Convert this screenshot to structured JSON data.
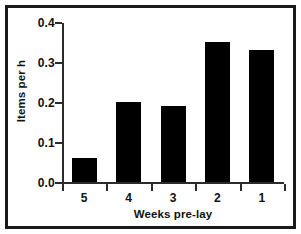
{
  "chart_data": {
    "type": "bar",
    "title": "",
    "xlabel": "Weeks pre-lay",
    "ylabel": "Items per h",
    "categories": [
      "5",
      "4",
      "3",
      "2",
      "1"
    ],
    "values": [
      0.06,
      0.2,
      0.19,
      0.35,
      0.33
    ],
    "ylim": [
      0.0,
      0.4
    ],
    "ytick_labels": [
      "0.0",
      "0.1",
      "0.2",
      "0.3",
      "0.4"
    ],
    "ytick_values": [
      0.0,
      0.1,
      0.2,
      0.3,
      0.4
    ],
    "grid": false,
    "legend": null,
    "bar_color": "#000000",
    "axis_color": "#2b2b2b",
    "background": "#ffffff",
    "frame_color": "#1a1a1a"
  }
}
